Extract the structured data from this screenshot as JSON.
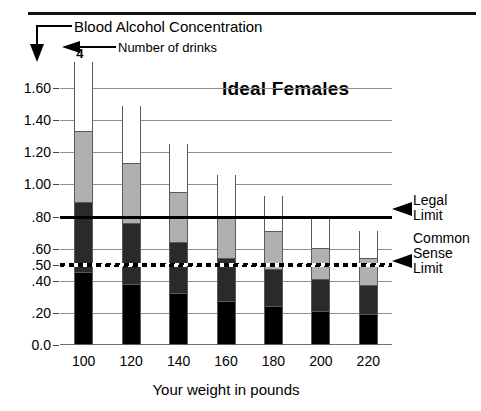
{
  "chart_data": {
    "type": "bar",
    "title": "Ideal Females",
    "xlabel": "Your weight in pounds",
    "ylabel": "Blood Alcohol Concentration",
    "categories": [
      "100",
      "120",
      "140",
      "160",
      "180",
      "200",
      "220"
    ],
    "ylim": [
      0.0,
      1.8
    ],
    "ytick_labels": [
      "1.60",
      "1.40",
      "1.20",
      "1.00",
      ".80",
      ".60",
      ".50",
      ".40",
      ".20",
      "0.0"
    ],
    "ytick_values": [
      1.6,
      1.4,
      1.2,
      1.0,
      0.8,
      0.6,
      0.5,
      0.4,
      0.2,
      0.0
    ],
    "gridlines": [
      1.6,
      1.4,
      1.2,
      1.0,
      0.6,
      0.4,
      0.2
    ],
    "grid": true,
    "legend_position": "none",
    "stack_labels": [
      "1",
      "2",
      "3",
      "4"
    ],
    "series": [
      {
        "name": "1 drink",
        "values": [
          0.44,
          0.37,
          0.31,
          0.26,
          0.23,
          0.2,
          0.18
        ]
      },
      {
        "name": "2 drinks",
        "values": [
          0.88,
          0.75,
          0.63,
          0.53,
          0.46,
          0.4,
          0.36
        ]
      },
      {
        "name": "3 drinks",
        "values": [
          1.32,
          1.12,
          0.94,
          0.79,
          0.7,
          0.59,
          0.53
        ]
      },
      {
        "name": "4 drinks",
        "values": [
          1.76,
          1.49,
          1.25,
          1.06,
          0.93,
          0.79,
          0.71
        ]
      }
    ],
    "reference_lines": [
      {
        "label": "Legal Limit",
        "value": 0.8,
        "style": "solid"
      },
      {
        "label": "Common Sense Limit",
        "value": 0.5,
        "style": "dashed"
      }
    ],
    "colors": {
      "drink1": "#000000",
      "drink2": "#2a2a2a",
      "drink3": "#b0b0b0",
      "drink4": "#ffffff",
      "grid": "#8e8e8e",
      "legal_limit": "#000000"
    }
  },
  "annotations": {
    "bac_callout": "Blood Alcohol Concentration",
    "drinks_callout": "Number of drinks",
    "legal_limit_line1": "Legal",
    "legal_limit_line2": "Limit",
    "sense_limit_line1": "Common",
    "sense_limit_line2": "Sense",
    "sense_limit_line3": "Limit"
  }
}
